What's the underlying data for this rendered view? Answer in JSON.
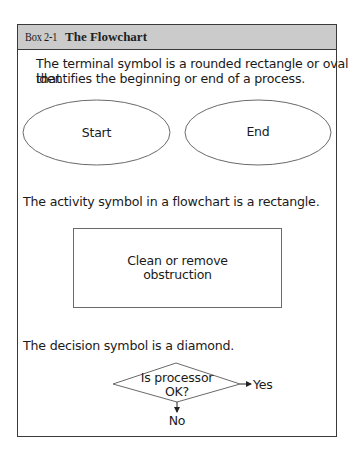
{
  "box": {
    "number": "Box 2-1",
    "title": "The Flowchart"
  },
  "sections": {
    "terminal": {
      "text": "The terminal symbol is a rounded rectangle or oval that identifies the beginning or end of a process.",
      "line1": "The terminal symbol is a rounded rectangle or oval that",
      "line2": "identifies the beginning or end of a process.",
      "shapes": [
        {
          "type": "oval",
          "label": "Start"
        },
        {
          "type": "oval",
          "label": "End"
        }
      ]
    },
    "activity": {
      "text": "The activity symbol in a flowchart is a rectangle.",
      "shape": {
        "type": "rectangle",
        "line1": "Clean or remove",
        "line2": "obstruction"
      }
    },
    "decision": {
      "text": "The decision symbol is a diamond.",
      "shape": {
        "type": "diamond",
        "line1": "Is processor",
        "line2": "OK?"
      },
      "branches": {
        "right": "Yes",
        "down": "No"
      }
    }
  },
  "colors": {
    "header_bg": "#cbcbcb",
    "border": "#3a3a3a",
    "shape_stroke": "#6a6a6a"
  }
}
